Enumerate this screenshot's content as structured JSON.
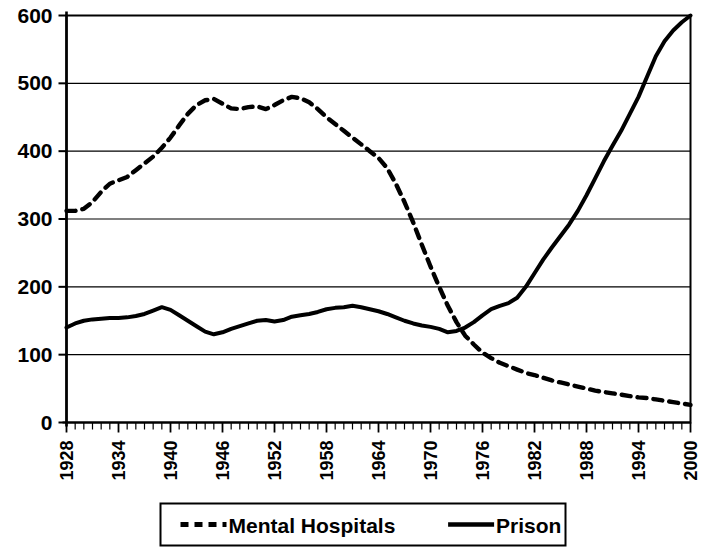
{
  "chart_data": {
    "type": "line",
    "title": "",
    "subtitle": "",
    "xlabel": "",
    "ylabel": "",
    "grid": true,
    "grid_axis": "y",
    "legend_position": "bottom",
    "xlim": [
      1928,
      2000
    ],
    "ylim": [
      0,
      600
    ],
    "ytick_labels": [
      "600",
      "500",
      "400",
      "300",
      "200",
      "100",
      "0"
    ],
    "ytick_values": [
      600,
      500,
      400,
      300,
      200,
      100,
      0
    ],
    "xtick_labels": [
      "1928",
      "1934",
      "1940",
      "1946",
      "1952",
      "1958",
      "1964",
      "1970",
      "1976",
      "1982",
      "1988",
      "1994",
      "2000"
    ],
    "xtick_values": [
      1928,
      1934,
      1940,
      1946,
      1952,
      1958,
      1964,
      1970,
      1976,
      1982,
      1988,
      1994,
      2000
    ],
    "minor_xticks_every": 1,
    "series": [
      {
        "name": "Mental Hospitals",
        "style": "dashed",
        "color": "#000000",
        "x": [
          1928,
          1929,
          1930,
          1931,
          1932,
          1933,
          1934,
          1935,
          1936,
          1937,
          1938,
          1939,
          1940,
          1941,
          1942,
          1943,
          1944,
          1945,
          1946,
          1947,
          1948,
          1949,
          1950,
          1951,
          1952,
          1953,
          1954,
          1955,
          1956,
          1957,
          1958,
          1959,
          1960,
          1961,
          1962,
          1963,
          1964,
          1965,
          1966,
          1967,
          1968,
          1969,
          1970,
          1971,
          1972,
          1973,
          1974,
          1975,
          1976,
          1977,
          1978,
          1979,
          1980,
          1981,
          1982,
          1983,
          1984,
          1985,
          1986,
          1987,
          1988,
          1989,
          1990,
          1991,
          1992,
          1993,
          1994,
          1995,
          1996,
          1997,
          1998,
          1999,
          2000
        ],
        "values": [
          312,
          312,
          315,
          325,
          340,
          352,
          357,
          362,
          372,
          382,
          392,
          405,
          420,
          438,
          455,
          468,
          475,
          477,
          470,
          463,
          462,
          465,
          466,
          462,
          468,
          475,
          480,
          478,
          472,
          462,
          450,
          440,
          430,
          420,
          410,
          400,
          390,
          375,
          352,
          325,
          295,
          262,
          230,
          200,
          172,
          148,
          128,
          115,
          103,
          95,
          88,
          83,
          78,
          73,
          70,
          66,
          62,
          59,
          56,
          53,
          50,
          47,
          45,
          43,
          41,
          39,
          37,
          36,
          34,
          32,
          30,
          28,
          26
        ]
      },
      {
        "name": "Prison",
        "style": "solid",
        "color": "#000000",
        "x": [
          1928,
          1929,
          1930,
          1931,
          1932,
          1933,
          1934,
          1935,
          1936,
          1937,
          1938,
          1939,
          1940,
          1941,
          1942,
          1943,
          1944,
          1945,
          1946,
          1947,
          1948,
          1949,
          1950,
          1951,
          1952,
          1953,
          1954,
          1955,
          1956,
          1957,
          1958,
          1959,
          1960,
          1961,
          1962,
          1963,
          1964,
          1965,
          1966,
          1967,
          1968,
          1969,
          1970,
          1971,
          1972,
          1973,
          1974,
          1975,
          1976,
          1977,
          1978,
          1979,
          1980,
          1981,
          1982,
          1983,
          1984,
          1985,
          1986,
          1987,
          1988,
          1989,
          1990,
          1991,
          1992,
          1993,
          1994,
          1995,
          1996,
          1997,
          1998,
          1999,
          2000
        ],
        "values": [
          140,
          146,
          150,
          152,
          153,
          154,
          154,
          155,
          157,
          160,
          165,
          170,
          166,
          158,
          150,
          142,
          134,
          130,
          133,
          138,
          142,
          146,
          150,
          151,
          149,
          151,
          156,
          158,
          160,
          163,
          167,
          169,
          170,
          172,
          170,
          167,
          164,
          160,
          155,
          150,
          146,
          143,
          141,
          138,
          133,
          135,
          140,
          148,
          158,
          167,
          172,
          176,
          184,
          200,
          220,
          240,
          258,
          275,
          292,
          312,
          335,
          360,
          385,
          408,
          430,
          455,
          480,
          510,
          540,
          562,
          578,
          590,
          600
        ]
      }
    ]
  },
  "legend": {
    "items": [
      {
        "label": "Mental Hospitals",
        "style": "dashed"
      },
      {
        "label": "Prison",
        "style": "solid"
      }
    ]
  }
}
